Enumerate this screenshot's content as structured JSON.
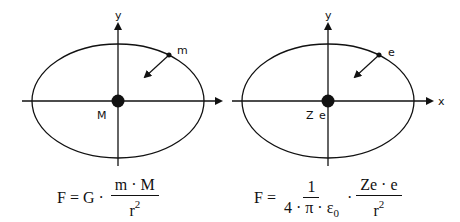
{
  "left_diagram": {
    "axis_y_label": "y",
    "orbiting_label": "m",
    "central_label": "M",
    "formula": {
      "lhs": "F",
      "equals": "=",
      "constant": "G",
      "dot": "·",
      "numerator": "m · M",
      "denominator_base": "r",
      "denominator_exp": "2"
    }
  },
  "right_diagram": {
    "axis_y_label": "y",
    "axis_x_label": "x",
    "orbiting_label": "e",
    "central_label": "Z e",
    "formula": {
      "lhs": "F",
      "equals": "=",
      "frac1_numerator": "1",
      "frac1_denominator_main": "4 · π · ε",
      "frac1_denominator_sub": "0",
      "dot": "·",
      "frac2_numerator": "Ze · e",
      "frac2_denominator_base": "r",
      "frac2_denominator_exp": "2"
    }
  },
  "colors": {
    "ink": "#111111",
    "background": "#ffffff"
  }
}
